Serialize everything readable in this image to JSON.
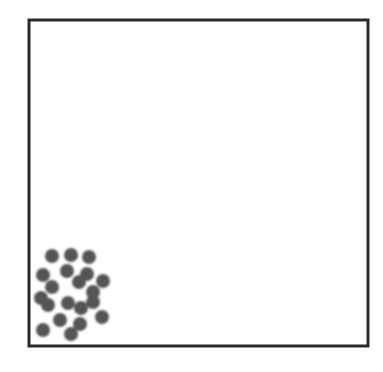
{
  "diagram": {
    "type": "particle-container",
    "background": "#ffffff",
    "container": {
      "x": 29,
      "y": 20,
      "width": 339,
      "height": 326,
      "stroke": "#2b2b2b",
      "stroke_width": 3
    },
    "particles": {
      "color": "#555555",
      "radius": 7,
      "count": 20,
      "points": [
        {
          "x": 52,
          "y": 256
        },
        {
          "x": 71,
          "y": 255
        },
        {
          "x": 89,
          "y": 257
        },
        {
          "x": 43,
          "y": 275
        },
        {
          "x": 67,
          "y": 271
        },
        {
          "x": 87,
          "y": 274
        },
        {
          "x": 103,
          "y": 281
        },
        {
          "x": 52,
          "y": 287
        },
        {
          "x": 79,
          "y": 282
        },
        {
          "x": 93,
          "y": 292
        },
        {
          "x": 41,
          "y": 298
        },
        {
          "x": 48,
          "y": 305
        },
        {
          "x": 68,
          "y": 303
        },
        {
          "x": 81,
          "y": 308
        },
        {
          "x": 93,
          "y": 302
        },
        {
          "x": 60,
          "y": 320
        },
        {
          "x": 80,
          "y": 324
        },
        {
          "x": 102,
          "y": 317
        },
        {
          "x": 43,
          "y": 330
        },
        {
          "x": 71,
          "y": 334
        }
      ]
    }
  }
}
